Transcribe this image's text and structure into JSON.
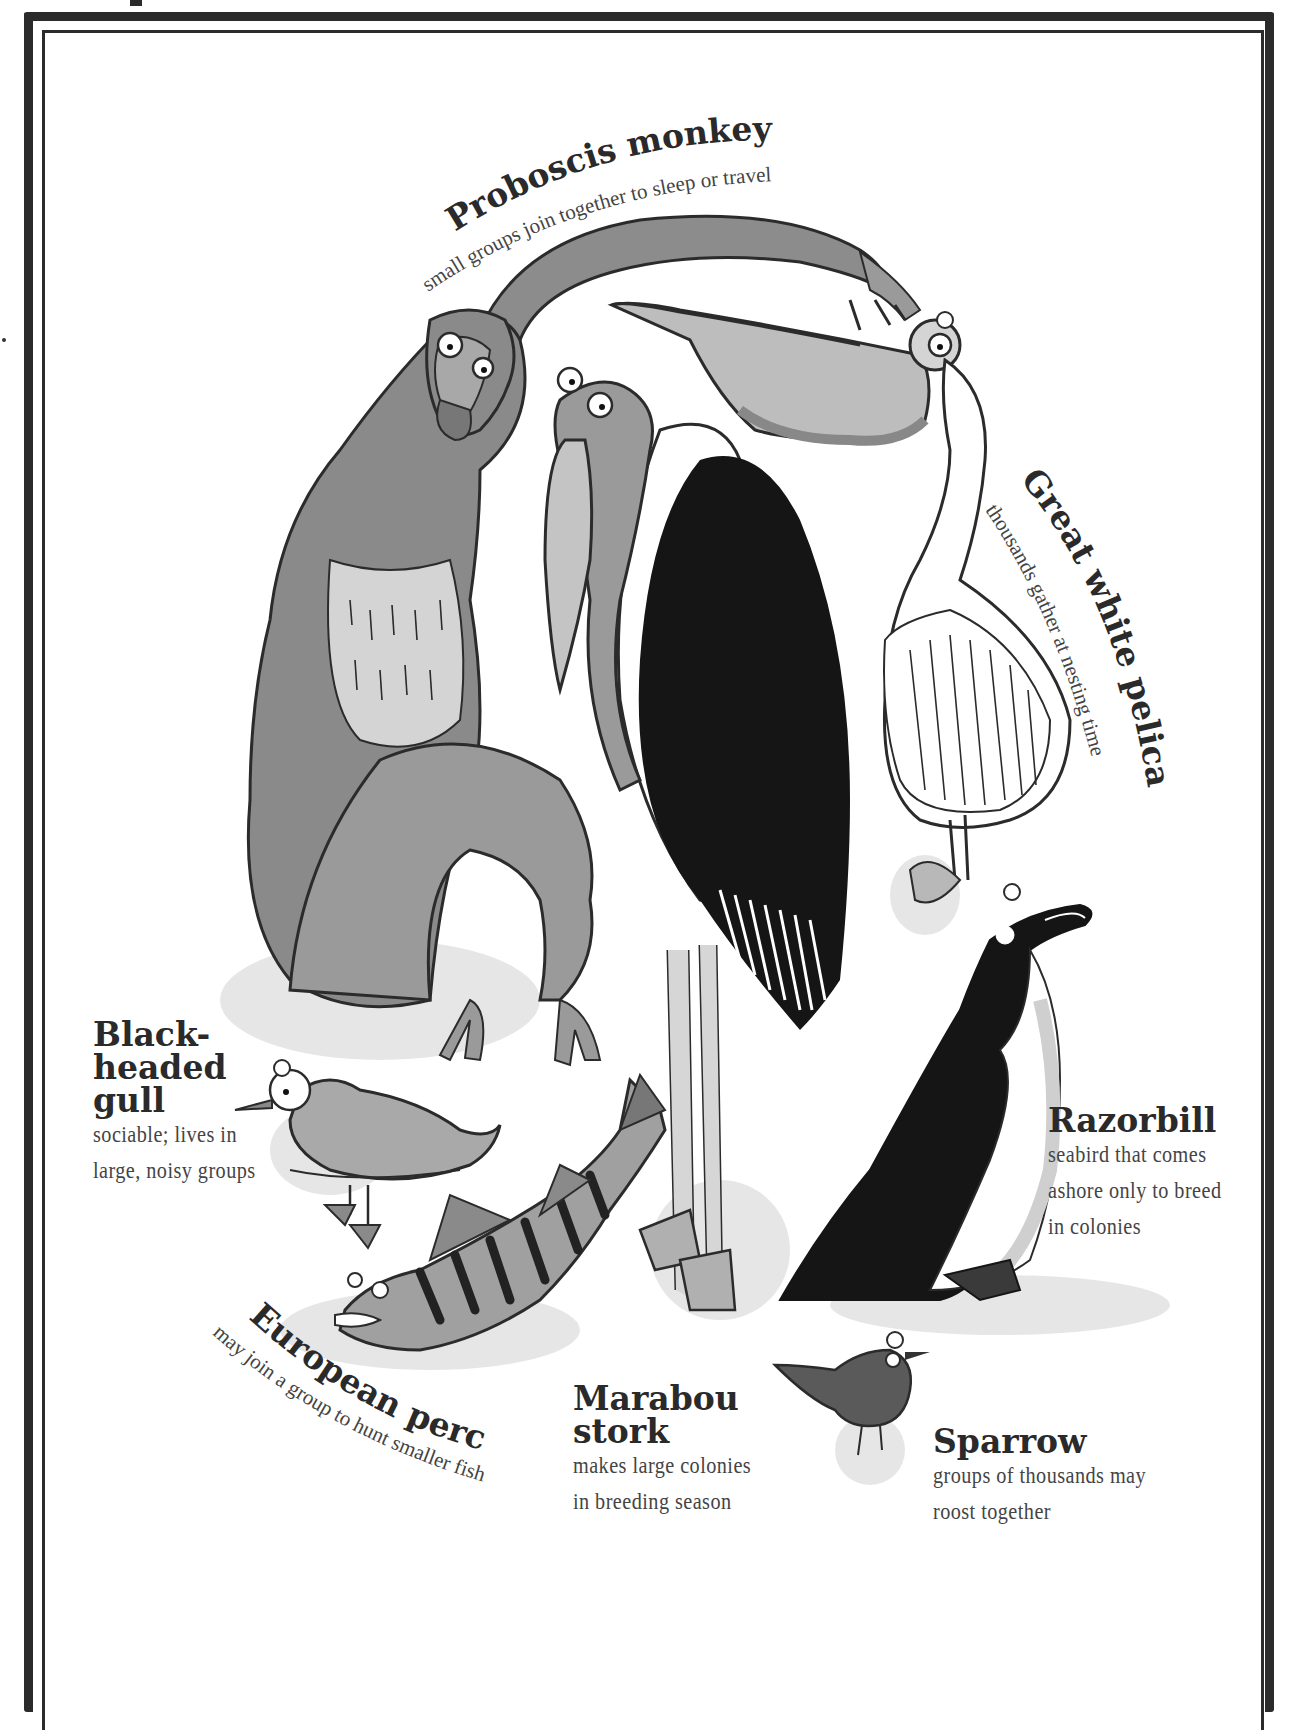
{
  "colors": {
    "ink": "#2b2b2b",
    "fur_dark": "#7a7a7a",
    "fur_mid": "#9a9a9a",
    "fur_light": "#d6d6d6",
    "shadow": "#e3e3e3",
    "black": "#151515"
  },
  "animals": {
    "proboscis_monkey": {
      "name": "Proboscis monkey",
      "desc": "small groups join together to sleep or travel"
    },
    "great_white_pelican": {
      "name": "Great white pelican",
      "desc": "thousands gather at nesting time"
    },
    "black_headed_gull": {
      "name_lines": [
        "Black-",
        "headed",
        "gull"
      ],
      "desc_lines": [
        "sociable; lives in",
        "large, noisy groups"
      ]
    },
    "razorbill": {
      "name": "Razorbill",
      "desc_lines": [
        "seabird that comes",
        "ashore only to breed",
        "in colonies"
      ]
    },
    "european_perch": {
      "name": "European perch",
      "desc": "may join a group to hunt smaller fish"
    },
    "marabou_stork": {
      "name_lines": [
        "Marabou",
        "stork"
      ],
      "desc_lines": [
        "makes large colonies",
        "in breeding season"
      ]
    },
    "sparrow": {
      "name": "Sparrow",
      "desc_lines": [
        "groups of thousands may",
        "roost together"
      ]
    }
  }
}
